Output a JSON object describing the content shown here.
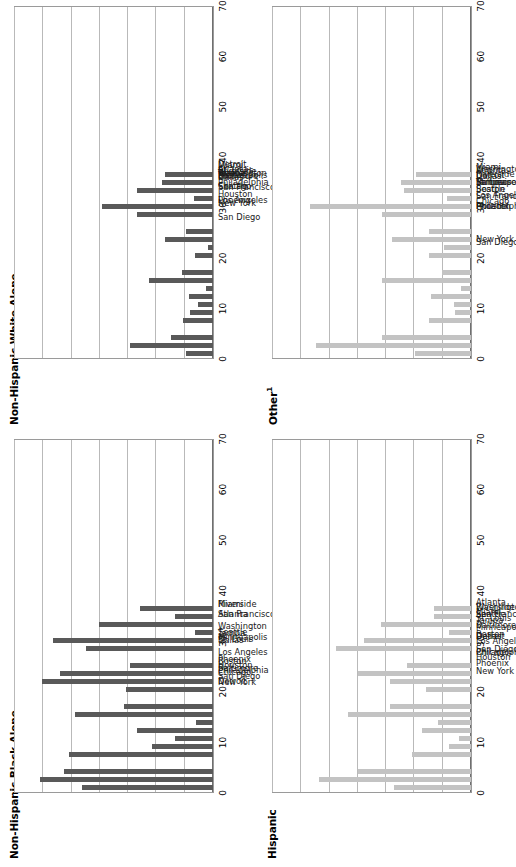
{
  "figure": {
    "orientation": "rotated-90",
    "background": "#ffffff",
    "bar_color_dark": "#595959",
    "bar_color_light": "#c3c3c3",
    "gridline_color": "#b9b9b9",
    "axis_color": "#9a9a9a"
  },
  "categories": [
    "Boston",
    "New York",
    "Philadelphia",
    "Baltimore",
    "Washington",
    "Atlanta",
    "Tampa",
    "Miami",
    "Houston",
    "Dallas",
    "St. Louis",
    "Detroit",
    "Chicago",
    "Minneapolis",
    "Phoenix",
    "San Diego",
    "Riverside",
    "Los Angeles",
    "San Francisco",
    "Seattle"
  ],
  "group_breaks": [
    3,
    10,
    14
  ],
  "axis": {
    "ticks": [
      "0",
      "10",
      "20",
      "30",
      "40",
      "50",
      "60",
      "70"
    ],
    "min": 0,
    "max": 70,
    "step": 10
  },
  "panels": [
    {
      "id": "non-hispanic-white-alone",
      "position": "top-left",
      "title": "Non-Hispanic White Alone",
      "title_sup": "",
      "shade": "dark"
    },
    {
      "id": "other",
      "position": "top-right",
      "title": "Other",
      "title_sup": "1",
      "shade": "light"
    },
    {
      "id": "non-hispanic-black-alone",
      "position": "bottom-left",
      "title": "Non-Hispanic Black Alone",
      "title_sup": "",
      "shade": "dark"
    },
    {
      "id": "hispanic",
      "position": "bottom-right",
      "title": "Hispanic",
      "title_sup": "",
      "shade": "light"
    }
  ],
  "chart_data": [
    {
      "type": "bar",
      "title": "Non-Hispanic White Alone",
      "xlabel": "",
      "ylabel": "",
      "ylim": [
        0,
        70
      ],
      "grid": true,
      "legend": "none",
      "categories": [
        "Boston",
        "New York",
        "Philadelphia",
        "Baltimore",
        "Washington",
        "Atlanta",
        "Tampa",
        "Miami",
        "Houston",
        "Dallas",
        "St. Louis",
        "Detroit",
        "Chicago",
        "Minneapolis",
        "Phoenix",
        "San Diego",
        "Riverside",
        "Los Angeles",
        "San Francisco",
        "Seattle"
      ],
      "values": [
        9.7,
        29.5,
        14.8,
        10.6,
        8.0,
        5.3,
        8.4,
        2.5,
        22.8,
        10.8,
        6.3,
        1.9,
        17.0,
        9.6,
        27.0,
        39.3,
        6.6,
        27.0,
        18.0,
        17.1
      ]
    },
    {
      "type": "bar",
      "title": "Other¹",
      "xlabel": "",
      "ylabel": "",
      "ylim": [
        0,
        70
      ],
      "grid": true,
      "legend": "none",
      "categories": [
        "Boston",
        "New York",
        "Philadelphia",
        "Baltimore",
        "Washington",
        "Atlanta",
        "Tampa",
        "Miami",
        "Houston",
        "Dallas",
        "St. Louis",
        "Detroit",
        "Chicago",
        "Minneapolis",
        "Phoenix",
        "San Diego",
        "Riverside",
        "Los Angeles",
        "San Francisco",
        "Seattle"
      ],
      "values": [
        19.7,
        54.7,
        31.3,
        14.7,
        5.6,
        6.1,
        14.3,
        3.6,
        31.6,
        10.4,
        14.7,
        9.6,
        28.0,
        14.7,
        31.5,
        56.8,
        8.6,
        23.6,
        24.6,
        19.6
      ]
    },
    {
      "type": "bar",
      "title": "Non-Hispanic Black Alone",
      "xlabel": "",
      "ylabel": "",
      "ylim": [
        0,
        70
      ],
      "grid": true,
      "legend": "none",
      "categories": [
        "Boston",
        "New York",
        "Philadelphia",
        "Baltimore",
        "Washington",
        "Atlanta",
        "Tampa",
        "Miami",
        "Houston",
        "Dallas",
        "St. Louis",
        "Detroit",
        "Chicago",
        "Minneapolis",
        "Phoenix",
        "San Diego",
        "Riverside",
        "Los Angeles",
        "San Francisco",
        "Seattle"
      ],
      "values": [
        46.2,
        61.0,
        52.8,
        51.0,
        21.6,
        13.4,
        26.8,
        5.9,
        48.8,
        31.3,
        30.6,
        60.3,
        54.2,
        29.3,
        44.8,
        56.7,
        6.2,
        40.2,
        13.4,
        25.7
      ]
    },
    {
      "type": "bar",
      "title": "Hispanic",
      "xlabel": "",
      "ylabel": "",
      "ylim": [
        0,
        70
      ],
      "grid": true,
      "legend": "none",
      "categories": [
        "Boston",
        "New York",
        "Philadelphia",
        "Baltimore",
        "Washington",
        "Atlanta",
        "Tampa",
        "Miami",
        "Houston",
        "Dallas",
        "St. Louis",
        "Detroit",
        "Chicago",
        "Minneapolis",
        "Phoenix",
        "San Diego",
        "Riverside",
        "Los Angeles",
        "San Francisco",
        "Seattle"
      ],
      "values": [
        27.2,
        53.6,
        40.0,
        20.8,
        7.8,
        4.4,
        17.2,
        11.8,
        43.6,
        28.8,
        16.0,
        28.8,
        40.0,
        22.6,
        47.6,
        38.0,
        7.8,
        32.0,
        13.0,
        13.0
      ]
    }
  ]
}
